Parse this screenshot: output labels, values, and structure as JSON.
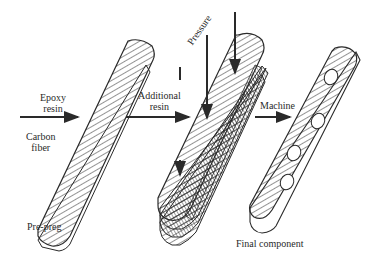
{
  "diagram": {
    "labels": {
      "epoxy_resin": [
        "Epoxy",
        "resin"
      ],
      "carbon_fiber": [
        "Carbon",
        "fiber"
      ],
      "pre_preg": "Pre-preg",
      "additional_resin": [
        "Additional",
        "resin"
      ],
      "pressure": "Pressure",
      "machine": "Machine",
      "final_component": "Final component"
    },
    "stages": [
      "Pre-preg",
      "Laminate under pressure",
      "Final component"
    ],
    "colors": {
      "ink": "#2a2a2a",
      "background": "#ffffff"
    },
    "final_component_holes": 4
  }
}
